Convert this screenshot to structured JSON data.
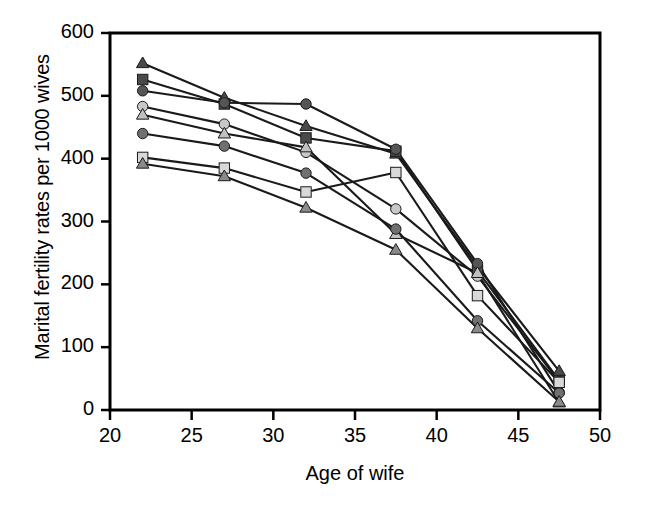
{
  "chart_data": {
    "type": "line",
    "title": "",
    "xlabel": "Age of wife",
    "ylabel": "Marital fertility rates per 1000 wives",
    "x": [
      22,
      27,
      32,
      37.5,
      42.5,
      47.5
    ],
    "xlim": [
      20,
      50
    ],
    "ylim": [
      0,
      600
    ],
    "xticks": [
      20,
      25,
      30,
      35,
      40,
      45,
      50
    ],
    "yticks": [
      0,
      100,
      200,
      300,
      400,
      500,
      600
    ],
    "grid": false,
    "legend": "none",
    "series": [
      {
        "name": "series-1",
        "marker": "triangle",
        "color": "#4a4a4a",
        "values": [
          552,
          497,
          452,
          408,
          228,
          62
        ]
      },
      {
        "name": "series-2",
        "marker": "square",
        "color": "#4a4a4a",
        "values": [
          526,
          487,
          433,
          412,
          222,
          47
        ]
      },
      {
        "name": "series-3",
        "marker": "circle",
        "color": "#555555",
        "values": [
          508,
          489,
          487,
          415,
          233,
          28
        ]
      },
      {
        "name": "series-4",
        "marker": "circle",
        "color": "#c8c8c8",
        "values": [
          483,
          455,
          410,
          320,
          213,
          45
        ]
      },
      {
        "name": "series-5",
        "marker": "triangle",
        "color": "#c0c0c0",
        "values": [
          470,
          440,
          418,
          280,
          218,
          12
        ]
      },
      {
        "name": "series-6",
        "marker": "circle",
        "color": "#707070",
        "values": [
          440,
          420,
          377,
          288,
          142,
          27
        ]
      },
      {
        "name": "series-7",
        "marker": "square",
        "color": "#d8d8d8",
        "values": [
          402,
          385,
          347,
          378,
          182,
          44
        ]
      },
      {
        "name": "series-8",
        "marker": "triangle",
        "color": "#8a8a8a",
        "values": [
          392,
          372,
          322,
          255,
          130,
          13
        ]
      }
    ]
  },
  "axes": {
    "y_tick_labels": [
      "600",
      "500",
      "400",
      "300",
      "200",
      "100",
      "0"
    ],
    "x_tick_labels": [
      "20",
      "25",
      "30",
      "35",
      "40",
      "45",
      "50"
    ]
  },
  "colors": {
    "axis": "#000000",
    "line": "#1a1a1a",
    "background": "#ffffff"
  }
}
